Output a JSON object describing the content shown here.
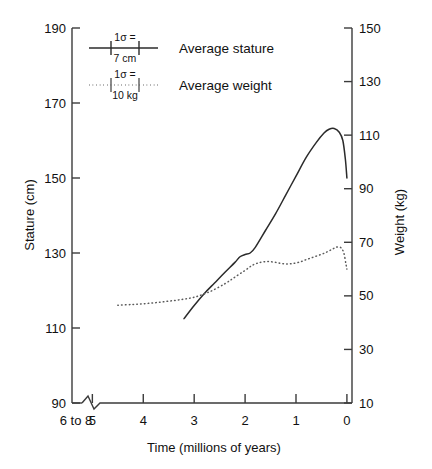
{
  "chart_data": {
    "type": "line",
    "title": "",
    "xlabel": "Time (millions of years)",
    "ylabel": "Stature (cm)",
    "y2label": "Weight (kg)",
    "grid": false,
    "legend_position": "upper-left-inside",
    "x_axis": {
      "label": "Time (millions of years)",
      "tick_labels": [
        "6 to 8",
        "5",
        "4",
        "3",
        "2",
        "1",
        "0"
      ],
      "tick_values": [
        6,
        5,
        4,
        3,
        2,
        1,
        0
      ],
      "direction": "reversed",
      "has_break": true,
      "break_note": "axis break between '6 to 8' and 5",
      "xlim": [
        5.4,
        -0.1
      ]
    },
    "y_axis_left": {
      "label": "Stature (cm)",
      "tick_labels": [
        "90",
        "110",
        "130",
        "150",
        "170",
        "190"
      ],
      "tick_values": [
        90,
        110,
        130,
        150,
        170,
        190
      ],
      "ylim": [
        90,
        190
      ]
    },
    "y_axis_right": {
      "label": "Weight (kg)",
      "tick_labels": [
        "10",
        "30",
        "50",
        "70",
        "90",
        "110",
        "130",
        "150"
      ],
      "tick_values": [
        10,
        30,
        50,
        70,
        90,
        110,
        130,
        150
      ],
      "ylim": [
        10,
        150
      ]
    },
    "series": [
      {
        "name": "Average stature",
        "style": "solid",
        "axis": "left",
        "units": "cm",
        "error_note": "1σ = 7 cm",
        "x": [
          3.2,
          3.0,
          2.8,
          2.6,
          2.4,
          2.2,
          2.1,
          2.0,
          1.9,
          1.8,
          1.6,
          1.4,
          1.2,
          1.0,
          0.8,
          0.6,
          0.45,
          0.35,
          0.25,
          0.15,
          0.08,
          0.03,
          0.0
        ],
        "y": [
          112.5,
          116.0,
          119.2,
          122.0,
          124.8,
          127.5,
          129.0,
          129.6,
          130.0,
          131.5,
          136.0,
          140.5,
          145.5,
          150.5,
          155.5,
          159.5,
          162.0,
          163.0,
          163.2,
          162.2,
          160.0,
          155.0,
          150.0
        ]
      },
      {
        "name": "Average weight",
        "style": "dotted",
        "axis": "right",
        "units": "kg",
        "error_note": "1σ = 10 kg",
        "x": [
          4.5,
          4.2,
          3.9,
          3.6,
          3.3,
          3.0,
          2.7,
          2.4,
          2.2,
          2.0,
          1.85,
          1.7,
          1.55,
          1.4,
          1.25,
          1.1,
          0.95,
          0.8,
          0.65,
          0.5,
          0.38,
          0.28,
          0.2,
          0.12,
          0.06,
          0.02,
          0.0
        ],
        "y": [
          46.5,
          46.8,
          47.2,
          47.8,
          48.5,
          49.5,
          51.5,
          54.5,
          57.0,
          59.5,
          61.5,
          62.5,
          62.8,
          62.5,
          62.0,
          62.0,
          62.5,
          63.5,
          64.5,
          65.5,
          66.5,
          67.5,
          68.2,
          68.0,
          66.0,
          62.0,
          60.0
        ]
      }
    ],
    "legend": [
      {
        "label": "Average stature",
        "sigma_line1": "1σ =",
        "sigma_line2": "7 cm",
        "style": "solid"
      },
      {
        "label": "Average weight",
        "sigma_line1": "1σ =",
        "sigma_line2": "10 kg",
        "style": "dotted"
      }
    ],
    "colors": {
      "stature": "#2b2b2b",
      "weight": "#5a5a5a",
      "axis": "#3b3b3b",
      "background": "#ffffff"
    }
  }
}
